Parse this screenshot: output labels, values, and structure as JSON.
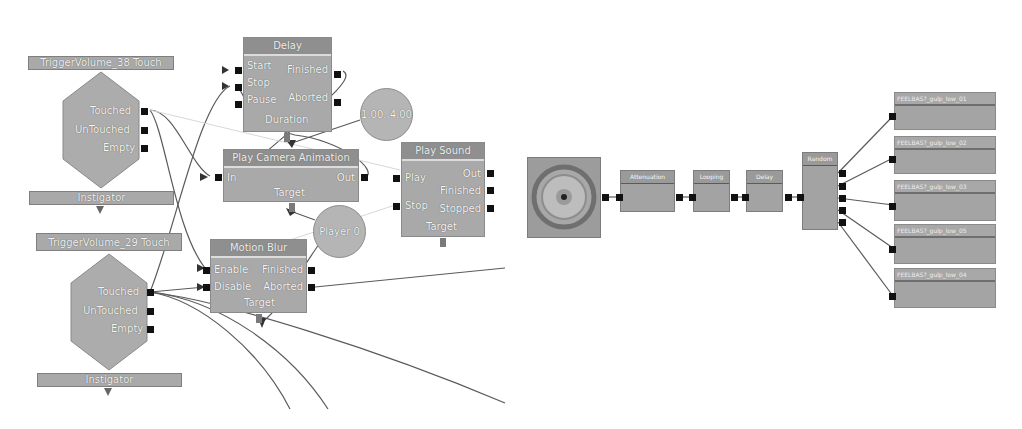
{
  "kismet": {
    "trigger1": {
      "title": "TriggerVolume_38 Touch",
      "outputs": [
        "Touched",
        "UnTouched",
        "Empty"
      ],
      "variable": "Instigator"
    },
    "trigger2": {
      "title": "TriggerVolume_29 Touch",
      "outputs": [
        "Touched",
        "UnTouched",
        "Empty"
      ],
      "variable": "Instigator"
    },
    "delay": {
      "title": "Delay",
      "inputs": [
        "Start",
        "Stop",
        "Pause"
      ],
      "outputs": [
        "Finished",
        "Aborted"
      ],
      "variable": "Duration"
    },
    "duration_value": {
      "label": "1.00..4.00"
    },
    "camera_anim": {
      "title": "Play Camera Animation",
      "input": "In",
      "output": "Out",
      "variable": "Target"
    },
    "player_var": {
      "label": "Player 0"
    },
    "play_sound": {
      "title": "Play Sound",
      "inputs": [
        "Play",
        "Stop"
      ],
      "outputs": [
        "Out",
        "Finished",
        "Stopped"
      ],
      "variable": "Target"
    },
    "motion_blur": {
      "title": "Motion Blur",
      "inputs": [
        "Enable",
        "Disable"
      ],
      "outputs": [
        "Finished",
        "Aborted"
      ],
      "variable": "Target"
    }
  },
  "sound_cue": {
    "attenuation": {
      "title": "Attenuation"
    },
    "looping": {
      "title": "Looping"
    },
    "delay": {
      "title": "Delay"
    },
    "random": {
      "title": "Random"
    },
    "waves": [
      {
        "title": "FEELBAS?_gulp_low_01"
      },
      {
        "title": "FEELBAS?_gulp_low_02"
      },
      {
        "title": "FEELBAS?_gulp_low_03"
      },
      {
        "title": "FEELBAS?_gulp_low_05"
      },
      {
        "title": "FEELBAS?_gulp_low_04"
      }
    ]
  },
  "colors": {
    "node": "#a9a9a9",
    "title": "#8f8f8f",
    "port": "#111111",
    "wire": "#555555"
  }
}
